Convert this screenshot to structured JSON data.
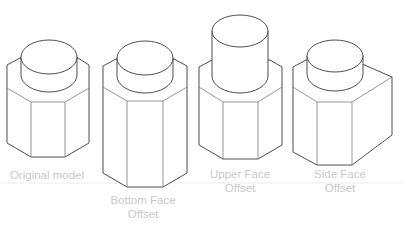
{
  "figure": {
    "type": "isometric-comparison",
    "colors": {
      "line": "#3a3a3a",
      "label": "#c9c9c9",
      "divider": "#ececec",
      "background": "#ffffff"
    },
    "models": [
      {
        "id": "original",
        "label_line1": "Original model",
        "label_line2": ""
      },
      {
        "id": "bottom-face-offset",
        "label_line1": "Bottom Face",
        "label_line2": "Offset"
      },
      {
        "id": "upper-face-offset",
        "label_line1": "Upper Face",
        "label_line2": "Offset"
      },
      {
        "id": "side-face-offset",
        "label_line1": "Side Face",
        "label_line2": "Offset"
      }
    ]
  }
}
